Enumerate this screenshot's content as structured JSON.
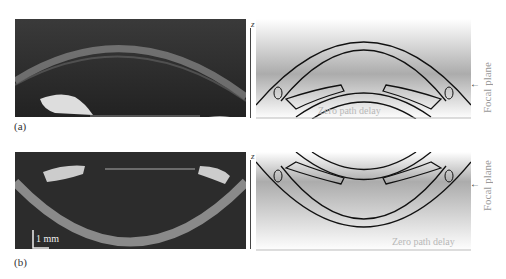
{
  "panels": [
    {
      "id": "a",
      "label": "(a)",
      "axis_label": "z",
      "focal_plane_label": "Focal plane",
      "zero_path_label": "Zero path delay"
    },
    {
      "id": "b",
      "label": "(b)",
      "axis_label": "z",
      "focal_plane_label": "Focal plane",
      "zero_path_label": "Zero path delay",
      "scale_bar": "1 mm"
    }
  ]
}
